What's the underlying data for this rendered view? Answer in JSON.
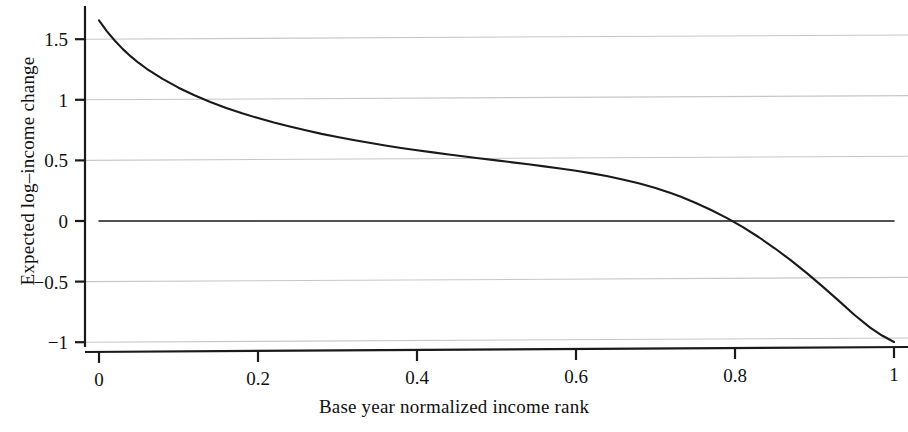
{
  "chart_data": {
    "type": "line",
    "title": "",
    "xlabel": "Base year normalized income rank",
    "ylabel": "Expected log–income change",
    "xlim": [
      0,
      1
    ],
    "ylim": [
      -1,
      1.72
    ],
    "xticks": [
      "0",
      "0.2",
      "0.4",
      "0.6",
      "0.8",
      "1"
    ],
    "xtick_values": [
      0,
      0.2,
      0.4,
      0.6,
      0.8,
      1
    ],
    "yticks": [
      "1.5",
      "1",
      "0.5",
      "0",
      "−0.5",
      "−1"
    ],
    "ytick_values": [
      1.5,
      1,
      0.5,
      0,
      -0.5,
      -1
    ],
    "grid": true,
    "grid_axis": "y",
    "grid_color": "#c7c7c7",
    "legend": null,
    "series": [
      {
        "name": "Expected log-income change",
        "color": "#1a1a1a",
        "line_width": 2.1,
        "x": [
          0.0,
          0.01,
          0.02,
          0.03,
          0.04,
          0.05,
          0.06,
          0.08,
          0.1,
          0.12,
          0.14,
          0.16,
          0.18,
          0.2,
          0.22,
          0.24,
          0.26,
          0.28,
          0.3,
          0.32,
          0.34,
          0.36,
          0.38,
          0.4,
          0.42,
          0.44,
          0.46,
          0.48,
          0.5,
          0.52,
          0.54,
          0.56,
          0.58,
          0.6,
          0.62,
          0.64,
          0.66,
          0.68,
          0.7,
          0.72,
          0.732,
          0.75,
          0.77,
          0.79,
          0.81,
          0.83,
          0.85,
          0.87,
          0.89,
          0.91,
          0.93,
          0.95,
          0.97,
          0.985,
          1.0
        ],
        "y": [
          1.655,
          1.565,
          1.487,
          1.418,
          1.358,
          1.304,
          1.256,
          1.172,
          1.1,
          1.037,
          0.982,
          0.933,
          0.889,
          0.849,
          0.812,
          0.779,
          0.748,
          0.719,
          0.693,
          0.668,
          0.645,
          0.623,
          0.603,
          0.584,
          0.566,
          0.549,
          0.532,
          0.516,
          0.5,
          0.484,
          0.468,
          0.451,
          0.433,
          0.414,
          0.393,
          0.369,
          0.341,
          0.309,
          0.272,
          0.229,
          0.2,
          0.151,
          0.091,
          0.024,
          -0.051,
          -0.134,
          -0.225,
          -0.323,
          -0.428,
          -0.539,
          -0.655,
          -0.773,
          -0.88,
          -0.945,
          -0.998
        ]
      },
      {
        "name": "zero reference line",
        "color": "#1a1a1a",
        "line_width": 1.6,
        "x": [
          0,
          1
        ],
        "y": [
          0,
          0
        ]
      }
    ],
    "annotations": []
  },
  "axes": {
    "y_title": "Expected log–income change",
    "x_title": "Base year normalized income rank"
  }
}
